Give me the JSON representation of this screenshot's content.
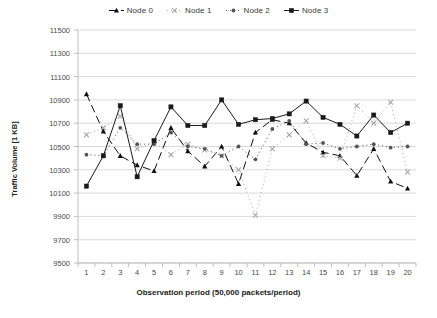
{
  "legend": {
    "position": "top-center",
    "entries": [
      {
        "label": "Node 0",
        "marker": "triangle",
        "dash": "8 4",
        "color": "#111111"
      },
      {
        "label": "Node 1",
        "marker": "x",
        "dash": "1 3",
        "color": "#a8a8a8"
      },
      {
        "label": "Node 2",
        "marker": "dot",
        "dash": "1 3",
        "color": "#555555"
      },
      {
        "label": "Node 3",
        "marker": "square",
        "dash": "0",
        "color": "#1a1a1a"
      }
    ]
  },
  "chart_data": {
    "type": "line",
    "title": "",
    "xlabel": "Observation period (50,000 packets/period)",
    "ylabel": "Traffic Volume [1 KB]",
    "xlim": [
      0.5,
      20.5
    ],
    "ylim": [
      9500,
      11500
    ],
    "ytick_step": 200,
    "grid": true,
    "categories": [
      1,
      2,
      3,
      4,
      5,
      6,
      7,
      8,
      9,
      10,
      11,
      12,
      13,
      14,
      15,
      16,
      17,
      18,
      19,
      20
    ],
    "yticks": [
      11500,
      11300,
      11100,
      10900,
      10700,
      10500,
      10300,
      10100,
      9900,
      9700,
      9500
    ],
    "ytick_labels": [
      "11500",
      "11300",
      "11100",
      "10900",
      "10700",
      "10500",
      "10300",
      "10100",
      "9900",
      "9700",
      "9500"
    ],
    "xtick_labels": [
      "1",
      "2",
      "3",
      "4",
      "5",
      "6",
      "7",
      "8",
      "9",
      "10",
      "11",
      "12",
      "13",
      "14",
      "15",
      "16",
      "17",
      "18",
      "19",
      "20"
    ],
    "series": [
      {
        "name": "Node 0",
        "marker": "triangle",
        "dash": "8 4",
        "color": "#111111",
        "values": [
          10950,
          10630,
          10420,
          10340,
          10290,
          10660,
          10460,
          10330,
          10500,
          10180,
          10620,
          10730,
          10700,
          10530,
          10450,
          10420,
          10250,
          10480,
          10200,
          10140
        ]
      },
      {
        "name": "Node 1",
        "marker": "x",
        "dash": "1 3",
        "color": "#a8a8a8",
        "values": [
          10600,
          10660,
          10760,
          10480,
          10540,
          10430,
          10520,
          10470,
          10420,
          10300,
          9910,
          10480,
          10600,
          10720,
          10420,
          10400,
          10850,
          10700,
          10880,
          10280
        ]
      },
      {
        "name": "Node 2",
        "marker": "dot",
        "dash": "1 3",
        "color": "#555555",
        "values": [
          10430,
          10420,
          10660,
          10520,
          10520,
          10620,
          10500,
          10480,
          10420,
          10500,
          10390,
          10650,
          10720,
          10520,
          10530,
          10480,
          10500,
          10520,
          10490,
          10500
        ]
      },
      {
        "name": "Node 3",
        "marker": "square",
        "dash": "0",
        "color": "#1a1a1a",
        "values": [
          10160,
          10420,
          10850,
          10240,
          10550,
          10840,
          10680,
          10680,
          10900,
          10690,
          10730,
          10740,
          10780,
          10890,
          10750,
          10690,
          10590,
          10770,
          10620,
          10700
        ]
      }
    ]
  },
  "geometry": {
    "plot_left": 78,
    "plot_right": 416,
    "plot_top": 30,
    "plot_bottom": 263
  }
}
